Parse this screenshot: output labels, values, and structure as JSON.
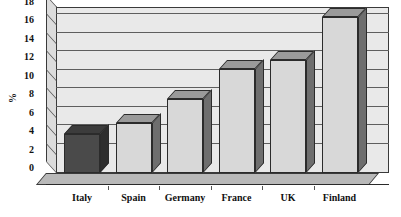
{
  "chart_data": {
    "type": "bar",
    "title": "",
    "subtitle": "",
    "xlabel": "",
    "ylabel": "%",
    "categories": [
      "Italy",
      "Spain",
      "Germany",
      "France",
      "UK",
      "Finland"
    ],
    "values": [
      4.2,
      5.4,
      8.0,
      11.3,
      12.3,
      16.9
    ],
    "series": [
      {
        "name": "%",
        "values": [
          4.2,
          5.4,
          8.0,
          11.3,
          12.3,
          16.9
        ]
      }
    ],
    "ylim": [
      0,
      18
    ],
    "ytick_step": 2,
    "ytick_labels": [
      "18",
      "16",
      "14",
      "12",
      "10",
      "8",
      "6",
      "4",
      "2",
      "0"
    ],
    "ytick_values": [
      18,
      16,
      14,
      12,
      10,
      8,
      6,
      4,
      2,
      0
    ],
    "grid": true,
    "grid_axis": "y",
    "legend": false,
    "legend_position": "none",
    "style": "3d",
    "bar_colors": [
      "#4a4a4a",
      "#d8d8d8",
      "#d8d8d8",
      "#d8d8d8",
      "#d8d8d8",
      "#d8d8d8"
    ],
    "bar_side_colors": [
      "#2e2e2e",
      "#6e6e6e",
      "#6e6e6e",
      "#6e6e6e",
      "#6e6e6e",
      "#6e6e6e"
    ],
    "bar_top_colors": [
      "#3c3c3c",
      "#9a9a9a",
      "#9a9a9a",
      "#9a9a9a",
      "#9a9a9a",
      "#9a9a9a"
    ],
    "highlighted_category": "Italy",
    "plot_background": "#e9e9e9",
    "floor_color": "#b9b9b9",
    "axis_color": "#2b2b2b",
    "gridline_color": "#5e5e5e",
    "text_color": "#111111",
    "page_background": "#ffffff"
  }
}
